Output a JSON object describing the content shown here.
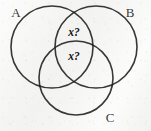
{
  "figure": {
    "kind": "venn-diagram",
    "width": 151,
    "height": 131,
    "background_color": "#f5f5f3",
    "stroke_color": "#1c1c1c"
  },
  "sets": [
    {
      "key": "A",
      "label": "A",
      "label_x": 16,
      "label_y": 14,
      "cx": 52,
      "cy": 47,
      "r": 41
    },
    {
      "key": "B",
      "label": "B",
      "label_x": 130,
      "label_y": 14,
      "cx": 96,
      "cy": 47,
      "r": 41
    },
    {
      "key": "C",
      "label": "C",
      "label_x": 110,
      "label_y": 119,
      "cx": 76,
      "cy": 78,
      "r": 37
    }
  ],
  "region_labels": [
    {
      "key": "ab-only",
      "text": "x?",
      "x": 74,
      "y": 33
    },
    {
      "key": "abc",
      "text": "x?",
      "x": 74,
      "y": 57
    }
  ]
}
